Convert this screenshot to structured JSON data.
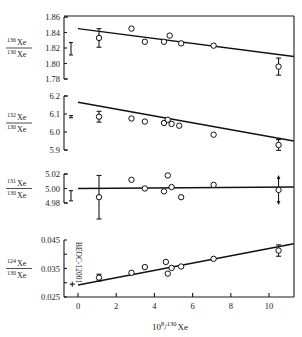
{
  "chart_data": {
    "type": "scatter",
    "title": "",
    "xlabel": {
      "prefix": "10",
      "sup": "8",
      "slash": "/",
      "sup2": "130",
      "suffix": "Xe"
    },
    "x_ticks": [
      0,
      2,
      4,
      6,
      8,
      10
    ],
    "xlim": [
      -0.6,
      11.3
    ],
    "grid": false,
    "panels": [
      {
        "name": "xe136",
        "ylabel": {
          "num_mass": "136",
          "num": "Xe",
          "den_mass": "130",
          "den": "Xe"
        },
        "ylim": [
          1.78,
          1.86
        ],
        "y_ticks": [
          1.78,
          1.8,
          1.82,
          1.84,
          1.86
        ],
        "y_tick_labels": [
          "1.78",
          "1.80",
          "1.82",
          "1.84",
          "1.86"
        ],
        "fit_line": {
          "x": [
            0.0,
            11.3
          ],
          "y": [
            1.845,
            1.809
          ]
        },
        "typical_error": {
          "y": 1.819,
          "err": 0.008
        },
        "points": [
          {
            "x": 1.1,
            "y": 1.833,
            "err": 0.012
          },
          {
            "x": 2.8,
            "y": 1.845
          },
          {
            "x": 3.5,
            "y": 1.828
          },
          {
            "x": 4.5,
            "y": 1.828
          },
          {
            "x": 4.8,
            "y": 1.836
          },
          {
            "x": 5.4,
            "y": 1.826
          },
          {
            "x": 7.1,
            "y": 1.823
          },
          {
            "x": 10.5,
            "y": 1.796,
            "err": 0.011
          }
        ]
      },
      {
        "name": "xe132",
        "ylabel": {
          "num_mass": "132",
          "num": "Xe",
          "den_mass": "130",
          "den": "Xe"
        },
        "ylim": [
          5.9,
          6.2
        ],
        "y_ticks": [
          5.9,
          6.0,
          6.1,
          6.2
        ],
        "y_tick_labels": [
          "5.9",
          "6.0",
          "6.1",
          "6.2"
        ],
        "fit_line": {
          "x": [
            0.0,
            11.3
          ],
          "y": [
            6.165,
            5.95
          ]
        },
        "typical_error": {
          "y": 6.085,
          "err": 0.006
        },
        "points": [
          {
            "x": 1.1,
            "y": 6.085,
            "err": 0.03
          },
          {
            "x": 2.8,
            "y": 6.075
          },
          {
            "x": 3.5,
            "y": 6.058
          },
          {
            "x": 4.5,
            "y": 6.05
          },
          {
            "x": 4.7,
            "y": 6.068
          },
          {
            "x": 4.9,
            "y": 6.045
          },
          {
            "x": 5.3,
            "y": 6.035
          },
          {
            "x": 7.1,
            "y": 5.985
          },
          {
            "x": 10.5,
            "y": 5.928,
            "err": 0.03
          }
        ]
      },
      {
        "name": "xe131",
        "ylabel": {
          "num_mass": "131",
          "num": "Xe",
          "den_mass": "130",
          "den": "Xe"
        },
        "ylim": [
          4.98,
          5.02
        ],
        "y_ticks": [
          4.98,
          5.0,
          5.02
        ],
        "y_tick_labels": [
          "4.98",
          "5.00",
          "5.02"
        ],
        "fit_line": {
          "x": [
            0.0,
            11.3
          ],
          "y": [
            5.0,
            5.002
          ]
        },
        "typical_error": {
          "y": 4.99,
          "err": 0.007
        },
        "points": [
          {
            "x": 1.1,
            "y": 4.988,
            "err": 0.03
          },
          {
            "x": 2.8,
            "y": 5.012
          },
          {
            "x": 3.5,
            "y": 5.0
          },
          {
            "x": 4.5,
            "y": 4.996
          },
          {
            "x": 4.7,
            "y": 5.018
          },
          {
            "x": 4.9,
            "y": 5.002
          },
          {
            "x": 5.4,
            "y": 4.988
          },
          {
            "x": 7.1,
            "y": 5.005
          },
          {
            "x": 10.5,
            "y": 4.998,
            "arrows": true
          }
        ]
      },
      {
        "name": "xe124",
        "ylabel": {
          "num_mass": "124",
          "num": "Xe",
          "den_mass": "130",
          "den": "Xe"
        },
        "ylim": [
          0.025,
          0.045
        ],
        "y_ticks": [
          0.025,
          0.03,
          0.035,
          0.04,
          0.045
        ],
        "y_tick_labels": [
          "0.025",
          "",
          "0.035",
          "",
          "0.045"
        ],
        "fit_line": {
          "x": [
            0.0,
            11.3
          ],
          "y": [
            0.0292,
            0.0437
          ]
        },
        "reference_point": {
          "x": -0.3,
          "y": 0.0295,
          "label": "BEOC-12001"
        },
        "points": [
          {
            "x": 1.1,
            "y": 0.0318,
            "err": 0.0012
          },
          {
            "x": 2.8,
            "y": 0.0335
          },
          {
            "x": 3.5,
            "y": 0.0355
          },
          {
            "x": 4.6,
            "y": 0.0373
          },
          {
            "x": 4.7,
            "y": 0.0332
          },
          {
            "x": 4.9,
            "y": 0.0352
          },
          {
            "x": 5.4,
            "y": 0.0357
          },
          {
            "x": 7.1,
            "y": 0.0384
          },
          {
            "x": 10.5,
            "y": 0.0413,
            "err": 0.002
          }
        ]
      }
    ]
  }
}
